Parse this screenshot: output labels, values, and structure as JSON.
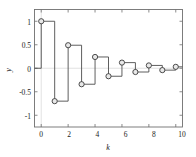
{
  "figure": {
    "background_color": "#ffffff",
    "frame_color": "#6f6f6f",
    "line_color": "#4d4d4d",
    "marker_fill": "#e8e8e8",
    "marker_edge": "#3a3a3a",
    "grid_color": "#cfcfcf"
  },
  "chart_data": {
    "type": "line",
    "plot_style": "stairs",
    "title": "",
    "xlabel": "k",
    "ylabel": "y",
    "x": [
      0,
      1,
      2,
      3,
      4,
      5,
      6,
      7,
      8,
      9,
      10
    ],
    "values": [
      1,
      -0.7,
      0.49,
      -0.34,
      0.24,
      -0.17,
      0.12,
      -0.08,
      0.06,
      -0.04,
      0.03
    ],
    "series": [
      {
        "name": "y[k]",
        "values": [
          1,
          -0.7,
          0.49,
          -0.34,
          0.24,
          -0.17,
          0.12,
          -0.08,
          0.06,
          -0.04,
          0.03
        ]
      }
    ],
    "xlim": [
      -0.5,
      10.5
    ],
    "ylim": [
      -1.25,
      1.25
    ],
    "xticks": [
      0,
      2,
      4,
      6,
      8,
      10
    ],
    "xtick_labels": [
      "0",
      "2",
      "4",
      "6",
      "8",
      "10"
    ],
    "yticks": [
      -1,
      -0.5,
      0,
      0.5,
      1
    ],
    "ytick_labels": [
      "-1",
      "-0.5",
      "0",
      "0.5",
      "1"
    ],
    "grid": true,
    "legend": null,
    "markers": "circle"
  },
  "axes": {
    "x_tick_0": "0",
    "x_tick_1": "2",
    "x_tick_2": "4",
    "x_tick_3": "6",
    "x_tick_4": "8",
    "x_tick_5": "10",
    "y_tick_0": "-1",
    "y_tick_1": "-0.5",
    "y_tick_2": "0",
    "y_tick_3": "0.5",
    "y_tick_4": "1",
    "x_axis_title": "k",
    "y_axis_title": "y"
  }
}
